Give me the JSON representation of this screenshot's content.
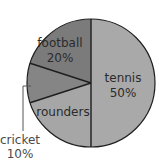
{
  "chart_data": {
    "type": "pie",
    "title": "",
    "categories": [
      "tennis",
      "rounders",
      "cricket",
      "football"
    ],
    "values": [
      50,
      20,
      10,
      20
    ],
    "value_labels": [
      "50%",
      "",
      "10%",
      "20%"
    ],
    "labels_shown": {
      "tennis": [
        "tennis",
        "50%"
      ],
      "rounders": [
        "rounders"
      ],
      "cricket": [
        "cricket",
        "10%"
      ],
      "football": [
        "football",
        "20%"
      ]
    },
    "colors": {
      "tennis": "#a9a9a9",
      "rounders": "#a6a6a6",
      "cricket": "#858585",
      "football": "#7b7b7b",
      "stroke": "#1e1e1e"
    },
    "start_angle_deg": 0,
    "direction": "clockwise from 12 o'clock",
    "legend": "none (inline labels)"
  },
  "labels": {
    "tennis": "tennis",
    "tennis_pct": "50%",
    "rounders": "rounders",
    "cricket": "cricket",
    "cricket_pct": "10%",
    "football": "football",
    "football_pct": "20%"
  }
}
